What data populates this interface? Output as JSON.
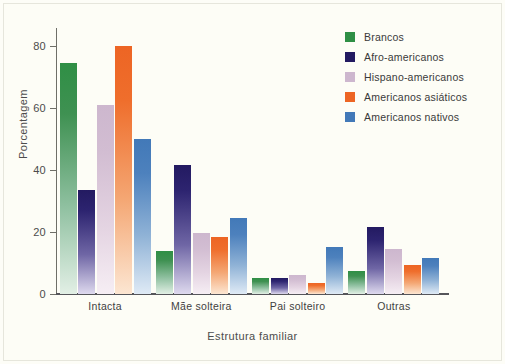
{
  "chart_data": {
    "type": "bar",
    "title": "",
    "xlabel": "Estrutura familiar",
    "ylabel": "Porcentagem",
    "categories": [
      "Intacta",
      "Mãe solteira",
      "Pai solteiro",
      "Outras"
    ],
    "ylim": [
      0,
      85
    ],
    "yticks": [
      0,
      20,
      40,
      60,
      80
    ],
    "ytick_labels": [
      "0",
      "20",
      "40",
      "60",
      "80"
    ],
    "grid": false,
    "legend_position": "top-right",
    "series": [
      {
        "name": "Brancos",
        "color": "#2f8f45",
        "values": [
          74.5,
          14.0,
          5.0,
          7.5
        ]
      },
      {
        "name": "Afro-americanos",
        "color": "#231a61",
        "values": [
          33.5,
          41.5,
          5.0,
          21.5
        ]
      },
      {
        "name": "Hispano-americanos",
        "color": "#cdb7ce",
        "values": [
          61.0,
          19.5,
          6.0,
          14.5
        ]
      },
      {
        "name": "Americanos asiáticos",
        "color": "#ed6524",
        "values": [
          80.0,
          18.5,
          3.5,
          9.5
        ]
      },
      {
        "name": "Americanos nativos",
        "color": "#4279b8",
        "values": [
          50.0,
          24.5,
          15.0,
          11.5
        ]
      }
    ]
  }
}
